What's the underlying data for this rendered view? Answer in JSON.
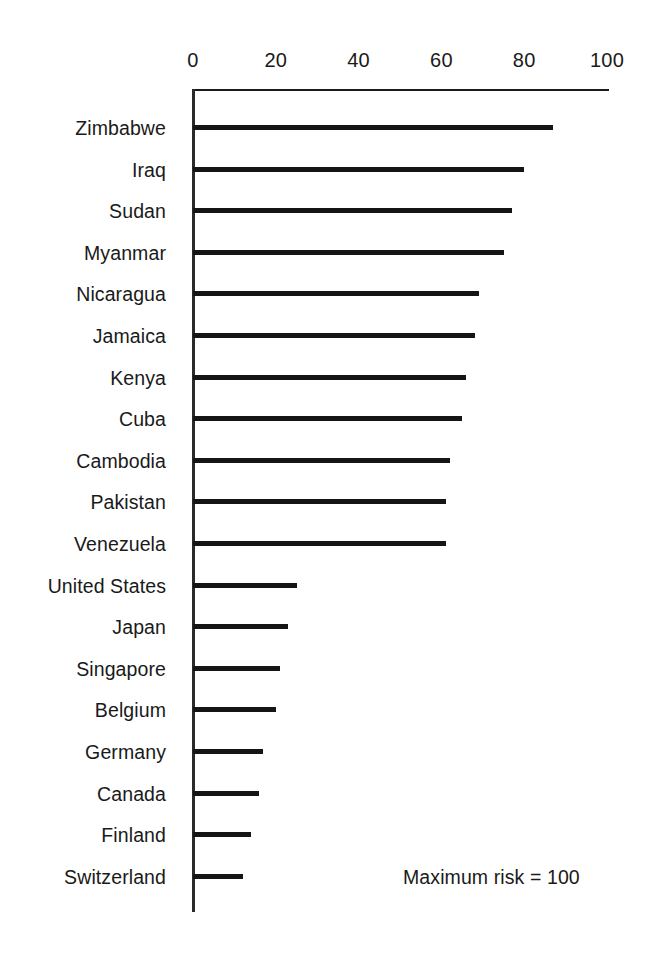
{
  "chart_data": {
    "type": "bar",
    "orientation": "horizontal",
    "title": "",
    "subtitle": "",
    "xlabel": "",
    "ylabel": "",
    "xlim": [
      0,
      100
    ],
    "ylim": null,
    "grid": false,
    "legend": null,
    "xticks": [
      0,
      20,
      40,
      60,
      80,
      100
    ],
    "xtick_labels": [
      "0",
      "20",
      "40",
      "60",
      "80",
      "100"
    ],
    "categories": [
      "Zimbabwe",
      "Iraq",
      "Sudan",
      "Myanmar",
      "Nicaragua",
      "Jamaica",
      "Kenya",
      "Cuba",
      "Cambodia",
      "Pakistan",
      "Venezuela",
      "United States",
      "Japan",
      "Singapore",
      "Belgium",
      "Germany",
      "Canada",
      "Finland",
      "Switzerland"
    ],
    "values": [
      87,
      80,
      77,
      75,
      69,
      68,
      66,
      65,
      62,
      61,
      61,
      25,
      23,
      21,
      20,
      17,
      16,
      14,
      12
    ],
    "annotations": [
      {
        "text": "Maximum risk = 100",
        "x": 60,
        "y": "Switzerland"
      }
    ],
    "series": [
      {
        "name": "Risk score",
        "values": [
          87,
          80,
          77,
          75,
          69,
          68,
          66,
          65,
          62,
          61,
          61,
          25,
          23,
          21,
          20,
          17,
          16,
          14,
          12
        ]
      }
    ]
  },
  "style": {
    "bar_color": "#151515",
    "axis_color": "#1a1a1a",
    "background": "#ffffff"
  },
  "annotation_text": "Maximum risk = 100"
}
